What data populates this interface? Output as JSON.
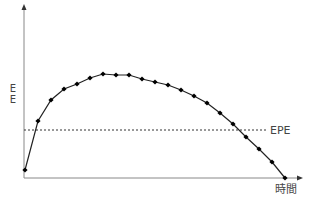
{
  "chart_data": {
    "type": "line",
    "title": "",
    "xlabel": "時間",
    "ylabel": "E E",
    "grid": false,
    "legend": null,
    "reference_lines": [
      {
        "label": "EPE",
        "orientation": "horizontal",
        "y": 48,
        "style": "dotted"
      }
    ],
    "series": [
      {
        "name": "Exposure",
        "x": [
          0,
          1,
          2,
          3,
          4,
          5,
          6,
          7,
          8,
          9,
          10,
          11,
          12,
          13,
          14,
          15,
          16,
          17,
          18,
          19,
          20
        ],
        "values": [
          8,
          57,
          78,
          89,
          94,
          100,
          104,
          103,
          103,
          99,
          96,
          93,
          88,
          82,
          75,
          65,
          54,
          41,
          29,
          16,
          0
        ]
      }
    ],
    "xlim": [
      0,
      20
    ],
    "ylim": [
      0,
      172
    ],
    "ticks": "none"
  },
  "labels": {
    "y_axis": "E\nE",
    "y_axis_top": "E",
    "y_axis_bottom": "E",
    "x_axis": "時間",
    "reference": "EPE"
  },
  "colors": {
    "axis": "#888888",
    "line": "#222222",
    "marker": "#000000",
    "reference": "#333333",
    "text": "#444444"
  }
}
